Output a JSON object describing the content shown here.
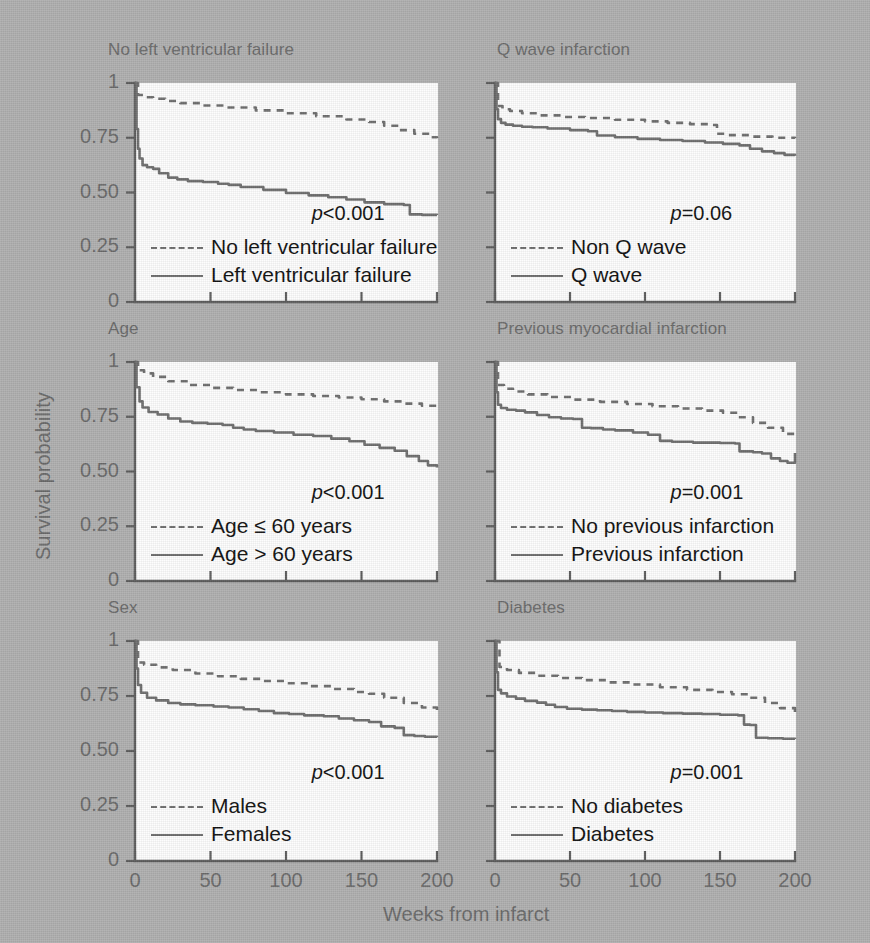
{
  "figure": {
    "y_axis_title": "Survival probability",
    "x_axis_title": "Weeks from infarct",
    "y_ticks": [
      "1",
      "0.75",
      "0.50",
      "0.25",
      "0"
    ],
    "x_ticks": [
      "0",
      "50",
      "100",
      "150",
      "200"
    ],
    "background_color": "#b0b0b0",
    "curve_color": "#6e6e6e",
    "axis_color": "#5d5d5d",
    "label_color": "#6a6a6a"
  },
  "chart_data": {
    "type": "line",
    "xlabel": "Weeks from infarct",
    "ylabel": "Survival probability",
    "xlim": [
      0,
      200
    ],
    "ylim": [
      0,
      1
    ],
    "xticks": [
      0,
      50,
      100,
      150,
      200
    ],
    "yticks": [
      0,
      0.25,
      0.5,
      0.75,
      1
    ],
    "grid": false,
    "legend_position": "inside-lower-left",
    "panels": [
      {
        "id": "no-left-ventricular-failure",
        "title": "No left ventricular failure",
        "p_value": "p<0.001",
        "p_prefix": "p",
        "p_rest": "<0.001",
        "series": [
          {
            "name": "No left ventricular failure",
            "style": "dashed",
            "x": [
              0,
              2,
              6,
              12,
              20,
              30,
              45,
              60,
              80,
              100,
              120,
              140,
              155,
              165,
              175,
              185,
              195,
              200
            ],
            "y": [
              1.0,
              0.945,
              0.935,
              0.928,
              0.918,
              0.908,
              0.897,
              0.888,
              0.875,
              0.862,
              0.848,
              0.833,
              0.822,
              0.805,
              0.785,
              0.768,
              0.752,
              0.748
            ]
          },
          {
            "name": "Left ventricular failure",
            "style": "solid",
            "x": [
              0,
              1,
              2,
              3,
              5,
              8,
              12,
              16,
              22,
              28,
              35,
              45,
              55,
              62,
              70,
              85,
              100,
              115,
              128,
              140,
              152,
              165,
              178,
              182,
              190,
              200
            ],
            "y": [
              1.0,
              0.79,
              0.7,
              0.655,
              0.625,
              0.615,
              0.608,
              0.588,
              0.568,
              0.56,
              0.552,
              0.548,
              0.54,
              0.535,
              0.525,
              0.512,
              0.498,
              0.487,
              0.478,
              0.468,
              0.455,
              0.447,
              0.443,
              0.4,
              0.398,
              0.397
            ]
          }
        ]
      },
      {
        "id": "q-wave-infarction",
        "title": "Q wave infarction",
        "p_value": "p=0.06",
        "p_prefix": "p",
        "p_rest": "=0.06",
        "series": [
          {
            "name": "Non Q wave",
            "style": "dashed",
            "x": [
              0,
              2,
              5,
              10,
              18,
              30,
              45,
              60,
              80,
              100,
              115,
              130,
              142,
              148,
              155,
              170,
              185,
              200
            ],
            "y": [
              1.0,
              0.895,
              0.88,
              0.872,
              0.862,
              0.852,
              0.845,
              0.84,
              0.832,
              0.825,
              0.818,
              0.812,
              0.808,
              0.768,
              0.762,
              0.755,
              0.75,
              0.748
            ]
          },
          {
            "name": "Q wave",
            "style": "solid",
            "x": [
              0,
              1,
              2,
              4,
              7,
              12,
              18,
              25,
              35,
              50,
              62,
              68,
              80,
              95,
              110,
              125,
              140,
              152,
              163,
              170,
              178,
              186,
              193,
              200
            ],
            "y": [
              1.0,
              0.88,
              0.835,
              0.818,
              0.81,
              0.805,
              0.8,
              0.798,
              0.792,
              0.785,
              0.78,
              0.76,
              0.752,
              0.745,
              0.74,
              0.735,
              0.728,
              0.722,
              0.715,
              0.7,
              0.688,
              0.68,
              0.672,
              0.668
            ]
          }
        ]
      },
      {
        "id": "age",
        "title": "Age",
        "p_value": "p<0.001",
        "p_prefix": "p",
        "p_rest": "<0.001",
        "series": [
          {
            "name": "Age ≤ 60 years",
            "style": "dashed",
            "x": [
              0,
              2,
              6,
              12,
              22,
              35,
              50,
              65,
              82,
              100,
              118,
              135,
              150,
              165,
              178,
              190,
              200
            ],
            "y": [
              1.0,
              0.962,
              0.948,
              0.932,
              0.912,
              0.895,
              0.882,
              0.872,
              0.862,
              0.852,
              0.845,
              0.838,
              0.83,
              0.82,
              0.81,
              0.8,
              0.792
            ]
          },
          {
            "name": "Age > 60 years",
            "style": "solid",
            "x": [
              0,
              1,
              3,
              5,
              9,
              15,
              22,
              30,
              38,
              48,
              58,
              65,
              72,
              80,
              92,
              105,
              118,
              130,
              142,
              152,
              162,
              172,
              180,
              188,
              194,
              200
            ],
            "y": [
              1.0,
              0.885,
              0.82,
              0.792,
              0.772,
              0.76,
              0.742,
              0.728,
              0.722,
              0.718,
              0.712,
              0.7,
              0.692,
              0.685,
              0.678,
              0.668,
              0.662,
              0.65,
              0.638,
              0.622,
              0.608,
              0.595,
              0.57,
              0.548,
              0.528,
              0.518
            ]
          }
        ]
      },
      {
        "id": "previous-myocardial-infarction",
        "title": "Previous myocardial infarction",
        "p_value": "p=0.001",
        "p_prefix": "p",
        "p_rest": "=0.001",
        "series": [
          {
            "name": "No previous infarction",
            "style": "dashed",
            "x": [
              0,
              2,
              6,
              12,
              22,
              35,
              52,
              70,
              88,
              105,
              122,
              138,
              152,
              162,
              172,
              182,
              192,
              200
            ],
            "y": [
              1.0,
              0.895,
              0.878,
              0.865,
              0.852,
              0.84,
              0.828,
              0.818,
              0.808,
              0.798,
              0.788,
              0.778,
              0.768,
              0.748,
              0.722,
              0.7,
              0.672,
              0.655
            ]
          },
          {
            "name": "Previous infarction",
            "style": "solid",
            "x": [
              0,
              1,
              2,
              4,
              8,
              14,
              20,
              28,
              36,
              44,
              52,
              58,
              64,
              72,
              80,
              92,
              102,
              110,
              118,
              132,
              150,
              160,
              163,
              172,
              178,
              184,
              190,
              195,
              200
            ],
            "y": [
              1.0,
              0.862,
              0.805,
              0.79,
              0.782,
              0.778,
              0.77,
              0.758,
              0.748,
              0.742,
              0.74,
              0.7,
              0.698,
              0.692,
              0.688,
              0.678,
              0.668,
              0.64,
              0.636,
              0.632,
              0.63,
              0.628,
              0.592,
              0.588,
              0.582,
              0.56,
              0.548,
              0.54,
              0.585
            ]
          }
        ]
      },
      {
        "id": "sex",
        "title": "Sex",
        "p_value": "p<0.001",
        "p_prefix": "p",
        "p_rest": "<0.001",
        "series": [
          {
            "name": "Males",
            "style": "dashed",
            "x": [
              0,
              2,
              6,
              14,
              25,
              40,
              55,
              70,
              85,
              100,
              115,
              130,
              145,
              155,
              165,
              178,
              190,
              200
            ],
            "y": [
              1.0,
              0.902,
              0.892,
              0.88,
              0.868,
              0.852,
              0.84,
              0.828,
              0.818,
              0.808,
              0.795,
              0.782,
              0.768,
              0.76,
              0.742,
              0.718,
              0.698,
              0.678
            ]
          },
          {
            "name": "Females",
            "style": "solid",
            "x": [
              0,
              1,
              2,
              4,
              8,
              14,
              22,
              30,
              40,
              52,
              62,
              72,
              82,
              92,
              102,
              112,
              125,
              135,
              145,
              155,
              163,
              172,
              178,
              185,
              192,
              200
            ],
            "y": [
              1.0,
              0.875,
              0.8,
              0.765,
              0.742,
              0.73,
              0.718,
              0.712,
              0.708,
              0.702,
              0.698,
              0.69,
              0.682,
              0.672,
              0.668,
              0.662,
              0.658,
              0.648,
              0.64,
              0.632,
              0.612,
              0.605,
              0.572,
              0.568,
              0.565,
              0.562
            ]
          }
        ]
      },
      {
        "id": "diabetes",
        "title": "Diabetes",
        "p_value": "p=0.001",
        "p_prefix": "p",
        "p_rest": "=0.001",
        "series": [
          {
            "name": "No diabetes",
            "style": "dashed",
            "x": [
              0,
              3,
              8,
              16,
              28,
              42,
              58,
              75,
              92,
              110,
              128,
              145,
              158,
              170,
              180,
              190,
              200
            ],
            "y": [
              1.0,
              0.882,
              0.868,
              0.855,
              0.842,
              0.832,
              0.822,
              0.812,
              0.802,
              0.79,
              0.778,
              0.768,
              0.758,
              0.742,
              0.718,
              0.695,
              0.672
            ]
          },
          {
            "name": "Diabetes",
            "style": "solid",
            "x": [
              0,
              1,
              2,
              4,
              8,
              14,
              20,
              28,
              34,
              40,
              48,
              58,
              68,
              78,
              88,
              100,
              112,
              125,
              138,
              150,
              162,
              166,
              170,
              174,
              182,
              192,
              200
            ],
            "y": [
              1.0,
              0.858,
              0.778,
              0.762,
              0.748,
              0.738,
              0.728,
              0.72,
              0.71,
              0.7,
              0.692,
              0.688,
              0.685,
              0.682,
              0.678,
              0.675,
              0.672,
              0.67,
              0.668,
              0.665,
              0.662,
              0.62,
              0.618,
              0.56,
              0.558,
              0.556,
              0.555
            ]
          }
        ]
      }
    ]
  }
}
